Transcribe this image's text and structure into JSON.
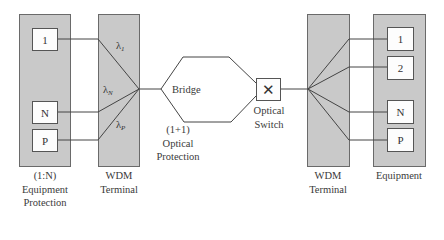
{
  "left_equipment": {
    "boxes": [
      "1",
      "N",
      "P"
    ],
    "label_lines": [
      "(1:N)",
      "Equipment",
      "Protection"
    ]
  },
  "left_wdm": {
    "label_lines": [
      "WDM",
      "Terminal"
    ],
    "wavelengths": [
      {
        "symbol": "λ",
        "subscript": "1"
      },
      {
        "symbol": "λ",
        "subscript": "N"
      },
      {
        "symbol": "λ",
        "subscript": "P"
      }
    ]
  },
  "bridge": {
    "label": "Bridge",
    "protection_lines": [
      "(1+1)",
      "Optical",
      "Protection"
    ]
  },
  "optical_switch": {
    "glyph": "✕",
    "label_lines": [
      "Optical",
      "Switch"
    ]
  },
  "right_wdm": {
    "label_lines": [
      "WDM",
      "Terminal"
    ]
  },
  "right_equipment": {
    "boxes": [
      "1",
      "2",
      "N",
      "P"
    ],
    "label": "Equipment"
  },
  "colors": {
    "panel_fill": "#c9c9c9",
    "panel_border": "#6a6a6a",
    "line": "#444444"
  }
}
